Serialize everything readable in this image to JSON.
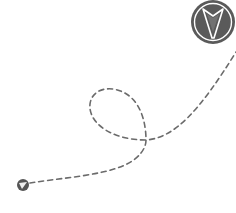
{
  "illustration": {
    "description": "Dashed flight path with loop from small plane marker to large circular arrowhead badge",
    "colors": {
      "path": "#6b6b6b",
      "badge_fill": "#5a5a5a",
      "badge_ring": "#ffffff",
      "marker_fill": "#555555",
      "background": "#ffffff"
    },
    "icons": {
      "start_marker": "paper-plane-icon",
      "end_badge": "arrowhead-badge-icon"
    }
  }
}
